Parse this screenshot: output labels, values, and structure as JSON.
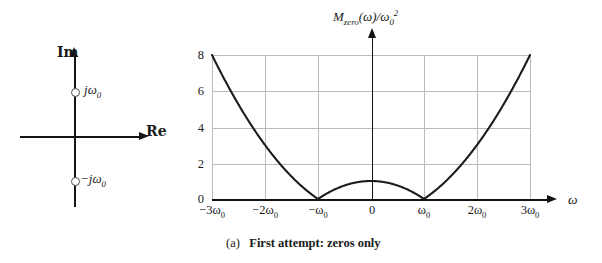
{
  "figure": {
    "caption_tag": "(a)",
    "caption_text": "First attempt: zeros only"
  },
  "splane": {
    "imag_axis_label": "Im",
    "real_axis_label": "Re",
    "zero_upper_label": "jω0",
    "zero_lower_label": "−jω0",
    "zeros": [
      {
        "name": "zero-upper",
        "label": "jω0",
        "position": "+j omega_0"
      },
      {
        "name": "zero-lower",
        "label": "−jω0",
        "position": "-j omega_0"
      }
    ]
  },
  "plot": {
    "y_axis_title": "Mzero(ω)/ω0²",
    "x_axis_title": "ω"
  },
  "chart_data": {
    "type": "line",
    "subtitle": "(a) First attempt: zeros only",
    "xlabel": "ω",
    "ylabel": "Mzero(ω)/ω0²",
    "xlim": [
      -3,
      3
    ],
    "ylim": [
      0,
      8
    ],
    "grid": true,
    "legend": null,
    "xtick_labels": [
      "−3ω0",
      "−2ω0",
      "−ω0",
      "0",
      "ω0",
      "2ω0",
      "3ω0"
    ],
    "xtick_values": [
      -3,
      -2,
      -1,
      0,
      1,
      2,
      3
    ],
    "ytick_labels": [
      "0",
      "2",
      "4",
      "6",
      "8"
    ],
    "ytick_values": [
      0,
      2,
      4,
      6,
      8
    ],
    "series": [
      {
        "name": "Mzero",
        "formula": "|ω² − ω0²| / ω0²",
        "x": [
          -3.0,
          -2.75,
          -2.5,
          -2.25,
          -2.0,
          -1.75,
          -1.5,
          -1.25,
          -1.0,
          -0.75,
          -0.5,
          -0.25,
          0.0,
          0.25,
          0.5,
          0.75,
          1.0,
          1.25,
          1.5,
          1.75,
          2.0,
          2.25,
          2.5,
          2.75,
          3.0
        ],
        "values": [
          8.0,
          6.5625,
          5.25,
          4.0625,
          3.0,
          2.0625,
          1.25,
          0.5625,
          0.0,
          0.4375,
          0.75,
          0.9375,
          1.0,
          0.9375,
          0.75,
          0.4375,
          0.0,
          0.5625,
          1.25,
          2.0625,
          3.0,
          4.0625,
          5.25,
          6.5625,
          8.0
        ]
      }
    ],
    "annotations": [
      {
        "text": "zero at ω = −ω0",
        "x": -1,
        "y": 0
      },
      {
        "text": "zero at ω = ω0",
        "x": 1,
        "y": 0
      }
    ]
  },
  "colors": {
    "curve": "#1c1c1c",
    "axis": "#121212",
    "grid": "#b9b9b9",
    "background": "#ffffff"
  }
}
